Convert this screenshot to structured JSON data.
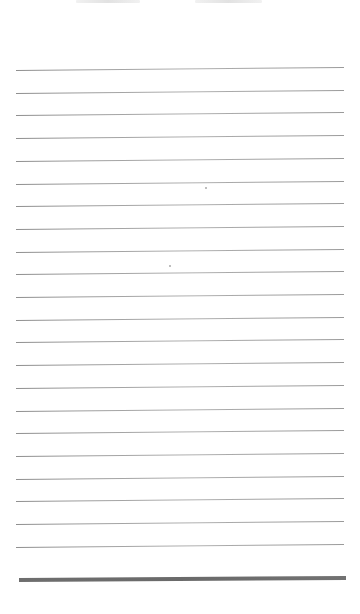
{
  "document": {
    "type": "lined-notepaper",
    "header_text_visible": false,
    "header_marks": [
      {
        "left": 76,
        "width": 64
      },
      {
        "left": 195,
        "width": 67
      }
    ],
    "rules": {
      "count": 22,
      "first_y": 70,
      "spacing": 22.7,
      "left": 16,
      "width": 328,
      "color": "#a0a0a0"
    },
    "bottom_bar": {
      "y": 578,
      "left": 19,
      "width": 327,
      "thickness": 4,
      "color": "#6a6a6a"
    },
    "specks": [
      {
        "x": 205,
        "y": 187
      },
      {
        "x": 169,
        "y": 265
      }
    ],
    "colors": {
      "paper": "#ffffff",
      "rule": "#a0a0a0",
      "bar": "#6a6a6a"
    }
  }
}
